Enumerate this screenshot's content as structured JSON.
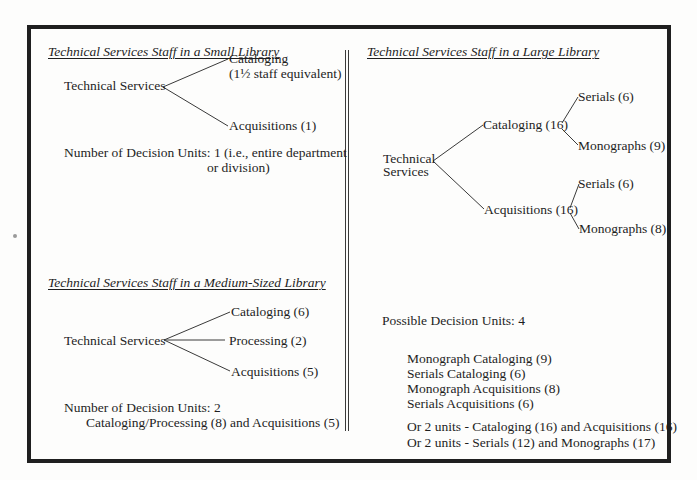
{
  "small_library": {
    "title": "Technical Services Staff in a Small Library",
    "root": "Technical Services",
    "branches": {
      "cataloging": "Cataloging",
      "cataloging_note": "(1½ staff equivalent)",
      "acquisitions": "Acquisitions (1)"
    },
    "decision_units_line1": "Number of Decision Units: 1 (i.e., entire department",
    "decision_units_line2": "or division)"
  },
  "medium_library": {
    "title": "Technical Services Staff in a Medium-Sized Library",
    "root": "Technical Services",
    "branches": {
      "cataloging": "Cataloging (6)",
      "processing": "Processing (2)",
      "acquisitions": "Acquisitions (5)"
    },
    "decision_units_line1": "Number of Decision Units: 2",
    "decision_units_line2": "Cataloging/Processing (8) and Acquisitions (5)"
  },
  "large_library": {
    "title": "Technical Services Staff in a Large Library",
    "root_line1": "Technical",
    "root_line2": "Services",
    "branches": {
      "cataloging": "Cataloging (16)",
      "cataloging_serials": "Serials (6)",
      "cataloging_monographs": "Monographs (9)",
      "acquisitions": "Acquisitions (16)",
      "acquisitions_serials": "Serials (6)",
      "acquisitions_monographs": "Monographs (8)"
    },
    "possible_units_label": "Possible Decision Units: 4",
    "units": [
      "Monograph Cataloging (9)",
      "Serials Cataloging (6)",
      "Monograph Acquisitions (8)",
      "Serials Acquisitions (6)"
    ],
    "alternatives": [
      "Or 2 units - Cataloging (16) and Acquisitions (16)",
      "Or 2 units - Serials (12) and Monographs (17)"
    ]
  },
  "colors": {
    "ink": "#1e1e1e",
    "border": "#1f1f1f",
    "paper": "#fdfdfc"
  }
}
